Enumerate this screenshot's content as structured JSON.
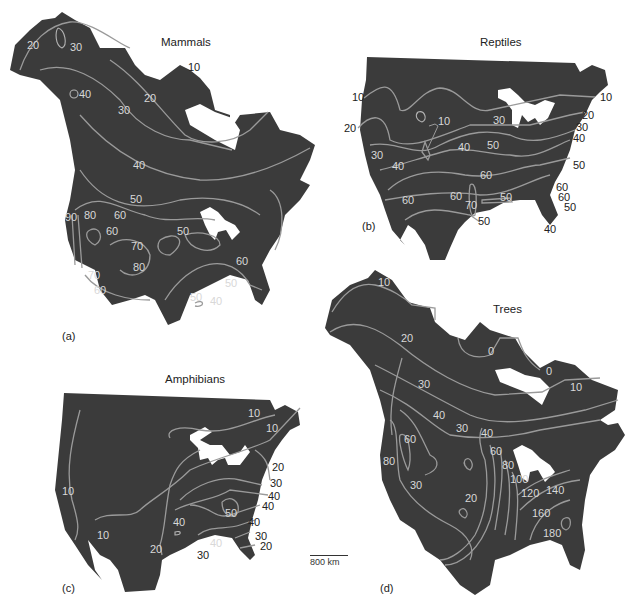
{
  "figure": {
    "panels": [
      {
        "id": "a",
        "panel_label": "(a)",
        "title": "Mammals",
        "contour_labels": [
          "20",
          "30",
          "10",
          "40",
          "20",
          "30",
          "40",
          "50",
          "90",
          "80",
          "60",
          "60",
          "70",
          "80",
          "50",
          "70",
          "60",
          "60",
          "50",
          "40",
          "50"
        ]
      },
      {
        "id": "b",
        "panel_label": "(b)",
        "title": "Reptiles",
        "contour_labels": [
          "10",
          "10",
          "20",
          "10",
          "30",
          "20",
          "30",
          "40",
          "30",
          "40",
          "40",
          "50",
          "50",
          "60",
          "60",
          "60",
          "60",
          "70",
          "50",
          "50",
          "60",
          "50",
          "40"
        ]
      },
      {
        "id": "c",
        "panel_label": "(c)",
        "title": "Amphibians",
        "contour_labels": [
          "10",
          "10",
          "20",
          "10",
          "30",
          "40",
          "40",
          "50",
          "40",
          "40",
          "10",
          "20",
          "30",
          "40",
          "30",
          "20"
        ]
      },
      {
        "id": "d",
        "panel_label": "(d)",
        "title": "Trees",
        "contour_labels": [
          "10",
          "20",
          "0",
          "0",
          "10",
          "30",
          "40",
          "30",
          "40",
          "60",
          "60",
          "80",
          "30",
          "80",
          "20",
          "100",
          "120",
          "140",
          "160",
          "180"
        ]
      }
    ],
    "scale_bar": {
      "label": "800  km",
      "length_km": 800
    }
  },
  "colors": {
    "land": "#3b3b3b",
    "contour": "#9a9a9a",
    "lakes": "#ffffff",
    "background": "#ffffff"
  }
}
